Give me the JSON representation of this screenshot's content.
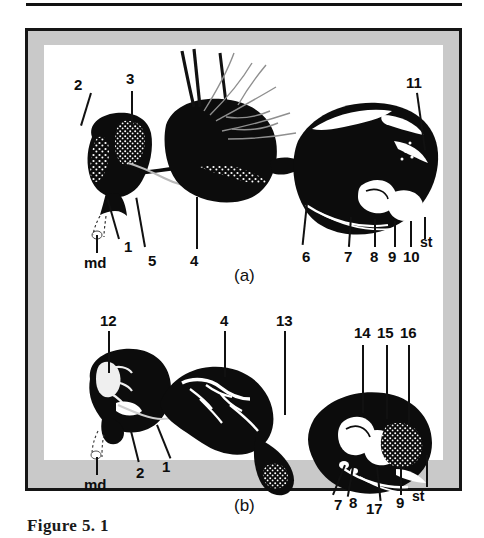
{
  "page": {
    "caption": "Figure 5. 1",
    "background_color": "#ffffff",
    "frame_border_color": "#151515",
    "frame_band_color": "#c9c9c9",
    "ink_color": "#111111"
  },
  "figure": {
    "panels": [
      {
        "id": "a",
        "panel_label": "(a)",
        "labels": [
          {
            "text": "2",
            "ref": "label-2-a"
          },
          {
            "text": "3",
            "ref": "label-3-a"
          },
          {
            "text": "1",
            "ref": "label-1-a"
          },
          {
            "text": "5",
            "ref": "label-5-a"
          },
          {
            "text": "4",
            "ref": "label-4-a"
          },
          {
            "text": "md",
            "ref": "label-md-a"
          },
          {
            "text": "6",
            "ref": "label-6-a"
          },
          {
            "text": "7",
            "ref": "label-7-a"
          },
          {
            "text": "8",
            "ref": "label-8-a"
          },
          {
            "text": "9",
            "ref": "label-9-a"
          },
          {
            "text": "10",
            "ref": "label-10-a"
          },
          {
            "text": "11",
            "ref": "label-11-a"
          },
          {
            "text": "st",
            "ref": "label-st-a"
          }
        ]
      },
      {
        "id": "b",
        "panel_label": "(b)",
        "labels": [
          {
            "text": "12",
            "ref": "label-12-b"
          },
          {
            "text": "4",
            "ref": "label-4-b"
          },
          {
            "text": "13",
            "ref": "label-13-b"
          },
          {
            "text": "14",
            "ref": "label-14-b"
          },
          {
            "text": "15",
            "ref": "label-15-b"
          },
          {
            "text": "16",
            "ref": "label-16-b"
          },
          {
            "text": "1",
            "ref": "label-1-b"
          },
          {
            "text": "2",
            "ref": "label-2-b"
          },
          {
            "text": "md",
            "ref": "label-md-b"
          },
          {
            "text": "7",
            "ref": "label-7-b"
          },
          {
            "text": "8",
            "ref": "label-8-b"
          },
          {
            "text": "17",
            "ref": "label-17-b"
          },
          {
            "text": "9",
            "ref": "label-9-b"
          },
          {
            "text": "st",
            "ref": "label-st-b"
          }
        ]
      }
    ]
  }
}
